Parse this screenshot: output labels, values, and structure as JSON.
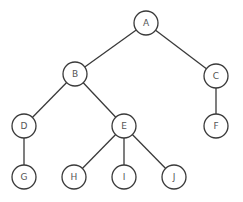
{
  "diagram": {
    "type": "tree",
    "colors": {
      "stroke": "#3a3a3a",
      "fill": "#ffffff",
      "label": "#555555"
    },
    "nodes": [
      {
        "id": "A",
        "label": "A"
      },
      {
        "id": "B",
        "label": "B"
      },
      {
        "id": "C",
        "label": "C"
      },
      {
        "id": "D",
        "label": "D"
      },
      {
        "id": "E",
        "label": "E"
      },
      {
        "id": "F",
        "label": "F"
      },
      {
        "id": "G",
        "label": "G"
      },
      {
        "id": "H",
        "label": "H"
      },
      {
        "id": "I",
        "label": "I"
      },
      {
        "id": "J",
        "label": "J"
      }
    ],
    "edges": [
      {
        "from": "A",
        "to": "B"
      },
      {
        "from": "A",
        "to": "C"
      },
      {
        "from": "B",
        "to": "D"
      },
      {
        "from": "B",
        "to": "E"
      },
      {
        "from": "C",
        "to": "F"
      },
      {
        "from": "D",
        "to": "G"
      },
      {
        "from": "E",
        "to": "H"
      },
      {
        "from": "E",
        "to": "I"
      },
      {
        "from": "E",
        "to": "J"
      }
    ]
  }
}
